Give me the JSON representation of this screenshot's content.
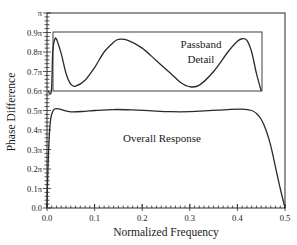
{
  "chart_data": {
    "type": "line",
    "title": "",
    "xlabel": "Normalized Frequency",
    "ylabel": "Phase Difference",
    "xlim": [
      0.0,
      0.5
    ],
    "ylim": [
      0.0,
      1.0
    ],
    "y_unit": "π",
    "grid": false,
    "legend": null,
    "x_ticks": [
      "0.0",
      "0.1",
      "0.2",
      "0.3",
      "0.4",
      "0.5"
    ],
    "y_ticks": [
      "0.0",
      "0.1π",
      "0.2π",
      "0.3π",
      "0.4π",
      "0.5π",
      "0.6π",
      "0.7π",
      "0.8π",
      "0.9π",
      "π"
    ],
    "annotations": [
      "Passband",
      "Detail",
      "Overall Response"
    ],
    "series": [
      {
        "name": "Overall Response",
        "x": [
          0.0,
          0.002,
          0.005,
          0.008,
          0.012,
          0.016,
          0.02,
          0.03,
          0.05,
          0.08,
          0.1,
          0.14,
          0.18,
          0.22,
          0.26,
          0.3,
          0.34,
          0.38,
          0.41,
          0.43,
          0.44,
          0.45,
          0.46,
          0.47,
          0.48,
          0.49,
          0.5
        ],
        "values": [
          0.0,
          0.2,
          0.38,
          0.46,
          0.495,
          0.507,
          0.51,
          0.505,
          0.493,
          0.496,
          0.5,
          0.505,
          0.503,
          0.498,
          0.494,
          0.494,
          0.499,
          0.505,
          0.507,
          0.5,
          0.485,
          0.455,
          0.4,
          0.32,
          0.21,
          0.1,
          0.0
        ]
      },
      {
        "name": "Passband Detail (expanded 0.6π–0.9π scale)",
        "x": [
          0.0,
          0.006,
          0.012,
          0.016,
          0.02,
          0.03,
          0.04,
          0.05,
          0.06,
          0.08,
          0.1,
          0.12,
          0.14,
          0.15,
          0.17,
          0.2,
          0.23,
          0.26,
          0.28,
          0.3,
          0.32,
          0.35,
          0.38,
          0.4,
          0.41,
          0.42,
          0.43,
          0.44,
          0.45
        ],
        "values": [
          0.6,
          0.6,
          0.8,
          0.862,
          0.865,
          0.79,
          0.69,
          0.635,
          0.625,
          0.655,
          0.72,
          0.8,
          0.85,
          0.865,
          0.86,
          0.82,
          0.755,
          0.69,
          0.645,
          0.622,
          0.63,
          0.7,
          0.8,
          0.855,
          0.868,
          0.86,
          0.8,
          0.69,
          0.6
        ]
      }
    ]
  }
}
